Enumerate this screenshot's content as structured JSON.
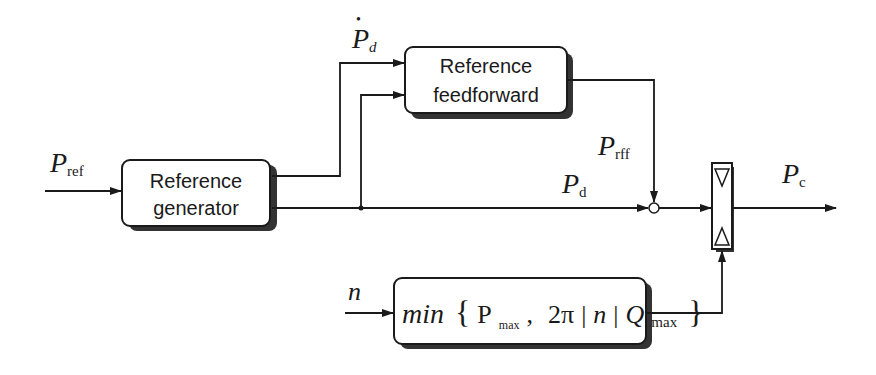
{
  "diagram": {
    "title": "",
    "blocks": {
      "reference_generator": {
        "line1": "Reference",
        "line2": "generator"
      },
      "reference_feedforward": {
        "line1": "Reference",
        "line2": "feedforward"
      },
      "limiter": {
        "min": "min",
        "brace_open": "{",
        "pmax": "P",
        "pmax_sub": "max",
        "comma": ",",
        "two_pi": "2π",
        "bar1": "|",
        "n": "n",
        "bar2": "|",
        "q": "Q",
        "q_sub": "max",
        "brace_close": "}"
      }
    },
    "signals": {
      "p_ref": {
        "main": "P",
        "sub": "ref"
      },
      "p_d_dot": {
        "main": "P",
        "sub": "d",
        "accent": "•"
      },
      "p_rff": {
        "main": "P",
        "sub": "rff"
      },
      "p_d": {
        "main": "P",
        "sub": "d"
      },
      "p_c": {
        "main": "P",
        "sub": "c"
      },
      "n": {
        "main": "n"
      }
    },
    "colors": {
      "line": "#1a1a1a",
      "background": "#ffffff"
    }
  }
}
